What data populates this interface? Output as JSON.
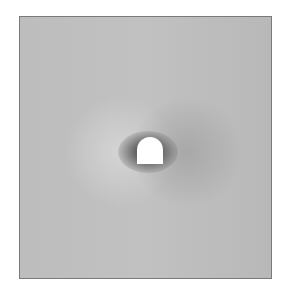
{
  "figure": {
    "colors": {
      "background": "#bdbdbd",
      "frame_border": "#7a7a7a",
      "object": "#ffffff",
      "ring": "#5a5a5a"
    }
  }
}
